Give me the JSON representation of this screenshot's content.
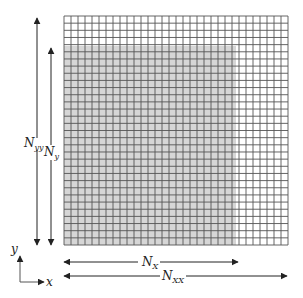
{
  "diagram": {
    "type": "domain-grid",
    "grid": {
      "columns": 32,
      "rows": 32,
      "x": 64,
      "y": 16,
      "width": 224,
      "height": 229,
      "line_color": "#555555",
      "background": "#ffffff"
    },
    "shaded_region": {
      "x": 64,
      "y": 46,
      "width": 172,
      "height": 199,
      "color": "#d6d6d6"
    },
    "labels": {
      "n_yy": {
        "base": "N",
        "sub": "yy"
      },
      "n_y": {
        "base": "N",
        "sub": "y"
      },
      "n_x": {
        "base": "N",
        "sub": "X"
      },
      "n_xx": {
        "base": "N",
        "sub": "XX"
      },
      "axis_x": "x",
      "axis_y": "y"
    },
    "colors": {
      "arrow": "#222222",
      "axis": "#555555"
    }
  }
}
